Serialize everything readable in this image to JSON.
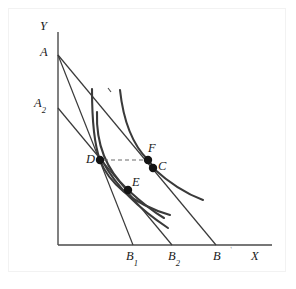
{
  "figure": {
    "type": "economics-indifference-curve-diagram",
    "background_color": "#ffffff",
    "ink_color": "#3a3a3a",
    "point_color": "#141414",
    "frame_color": "#f2f2f2"
  },
  "axes": {
    "y_label": "Y",
    "x_label": "X",
    "origin_px": {
      "x": 58,
      "y": 245
    },
    "y_top_px": 32,
    "x_right_px": 272
  },
  "intercept_labels": {
    "a_label": "A",
    "a2_label_main": "A",
    "a2_label_sub": "2"
  },
  "x_axis_ticks": [
    {
      "label_main": "B",
      "label_sub": "1",
      "x_px": 133
    },
    {
      "label_main": "B",
      "label_sub": "2",
      "x_px": 172
    },
    {
      "label_main": "B",
      "label_sub": "",
      "x_px": 216
    }
  ],
  "points": [
    {
      "name": "D",
      "label": "D",
      "x_px": 100,
      "y_px": 160
    },
    {
      "name": "F",
      "label": "F",
      "x_px": 148,
      "y_px": 160
    },
    {
      "name": "C",
      "label": "C",
      "x_px": 153,
      "y_px": 168
    },
    {
      "name": "E",
      "label": "E",
      "x_px": 128,
      "y_px": 190
    }
  ],
  "budget_lines": [
    {
      "name": "budget-line-AB",
      "from": "A",
      "to": "B"
    },
    {
      "name": "budget-line-AB1",
      "from": "A",
      "to": "B1"
    },
    {
      "name": "budget-line-A2B2",
      "from": "A2",
      "to": "B2"
    }
  ],
  "indifference_curves": [
    {
      "name": "indifference-curve-high",
      "through": [
        "F",
        "C"
      ]
    },
    {
      "name": "indifference-curve-middle",
      "through": [
        "D"
      ]
    },
    {
      "name": "indifference-curve-low",
      "through": [
        "E"
      ]
    }
  ],
  "guides": [
    {
      "name": "dashed-income-line",
      "from": "D",
      "to": "F",
      "style": "dashed"
    }
  ]
}
